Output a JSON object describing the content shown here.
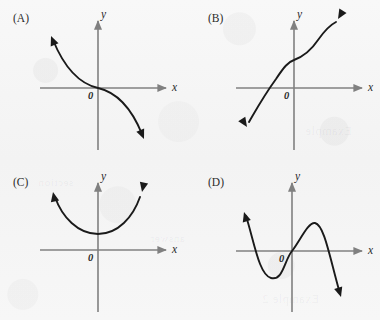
{
  "figure": {
    "kind": "multiple-choice-graph-figure",
    "background_color": "#f6f6f6",
    "axis_color": "#808080",
    "curve_color": "#1a1a1a",
    "text_color": "#2b2b2b"
  },
  "panels": [
    {
      "id": "A",
      "label": "(A)",
      "label_x": 13,
      "label_y": 12,
      "x_axis_label": "x",
      "y_axis_label": "y",
      "origin_label": "0",
      "description": "decreasing cubic through the origin",
      "axes": {
        "origin_x": 98,
        "origin_y": 88,
        "x_left": 40,
        "x_right": 168,
        "y_top": 19,
        "y_bottom": 150
      },
      "x_label_pos": {
        "x": 172,
        "y": 81
      },
      "y_label_pos": {
        "x": 101,
        "y": 8
      },
      "origin_label_pos": {
        "x": 88,
        "y": 90
      },
      "curve": "M 53,40 C 62,62 76,83 98,88 C 120,93 133,112 142,134",
      "arrows": [
        {
          "x": 51,
          "y": 36,
          "angle": -112
        },
        {
          "x": 144,
          "y": 138,
          "angle": 68
        }
      ]
    },
    {
      "id": "B",
      "label": "(B)",
      "label_x": 208,
      "label_y": 12,
      "x_axis_label": "x",
      "y_axis_label": "y",
      "origin_label": "0",
      "description": "increasing cubic shifted left, positive y-intercept",
      "axes": {
        "origin_x": 294,
        "origin_y": 88,
        "x_left": 236,
        "x_right": 364,
        "y_top": 19,
        "y_bottom": 150
      },
      "x_label_pos": {
        "x": 368,
        "y": 81
      },
      "y_label_pos": {
        "x": 297,
        "y": 8
      },
      "origin_label_pos": {
        "x": 284,
        "y": 90
      },
      "curve": "M 249,122 C 256,110 262,98 275,79 C 284,66 288,62 294,60 C 302,57 310,52 318,40 C 325,30 330,26 336,22",
      "arrows": [
        {
          "x": 247,
          "y": 126,
          "angle": 117
        },
        {
          "x": 338,
          "y": 19,
          "angle": -55
        }
      ]
    },
    {
      "id": "C",
      "label": "(C)",
      "label_x": 13,
      "label_y": 176,
      "x_axis_label": "x",
      "y_axis_label": "y",
      "origin_label": "0",
      "description": "upward parabola with vertex above the x-axis",
      "axes": {
        "origin_x": 98,
        "origin_y": 250,
        "x_left": 40,
        "x_right": 168,
        "y_top": 181,
        "y_bottom": 312
      },
      "x_label_pos": {
        "x": 172,
        "y": 243
      },
      "y_label_pos": {
        "x": 101,
        "y": 170
      },
      "origin_label_pos": {
        "x": 88,
        "y": 252
      },
      "curve": "M 55,196 C 62,216 78,234 98,234 C 118,234 132,216 139,196",
      "arrows": [
        {
          "x": 53,
          "y": 192,
          "angle": -110
        },
        {
          "x": 141,
          "y": 192,
          "angle": -70
        }
      ]
    },
    {
      "id": "D",
      "label": "(D)",
      "label_x": 208,
      "label_y": 176,
      "x_axis_label": "x",
      "y_axis_label": "y",
      "origin_label": "0",
      "description": "cubic with negative leading coefficient, local min left of origin and local max right of origin",
      "axes": {
        "origin_x": 292,
        "origin_y": 251,
        "x_left": 236,
        "x_right": 364,
        "y_top": 181,
        "y_bottom": 312
      },
      "x_label_pos": {
        "x": 368,
        "y": 244
      },
      "y_label_pos": {
        "x": 295,
        "y": 170
      },
      "origin_label_pos": {
        "x": 279,
        "y": 253
      },
      "curve": "M 246,216 C 254,240 260,275 272,278 C 284,281 284,260 292,251 C 301,240 308,222 315,223 C 324,225 328,252 340,292",
      "arrows": [
        {
          "x": 244,
          "y": 212,
          "angle": -107
        },
        {
          "x": 342,
          "y": 297,
          "angle": 73
        }
      ]
    }
  ],
  "ghost_marks": [
    {
      "text": "Example",
      "x": 305,
      "y": 124,
      "size": 12,
      "opacity": 0.05
    },
    {
      "text": "Example 2",
      "x": 262,
      "y": 292,
      "size": 12,
      "opacity": 0.05
    },
    {
      "text": "section",
      "x": 38,
      "y": 176,
      "size": 11,
      "opacity": 0.04
    },
    {
      "text": "answer",
      "x": 150,
      "y": 232,
      "size": 11,
      "opacity": 0.035
    }
  ]
}
